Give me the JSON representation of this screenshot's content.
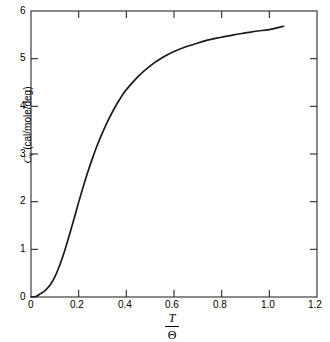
{
  "chart_data": {
    "type": "line",
    "title": "",
    "subtitle": "",
    "xlabel_numerator": "T",
    "xlabel_denominator": "Θ",
    "ylabel_symbol": "C",
    "ylabel_subscript": "v",
    "ylabel_units": "(cal/mole/deg)",
    "ylabel_full": "C_v (cal/mole/deg)",
    "xlim": [
      0,
      1.2
    ],
    "ylim": [
      0,
      6
    ],
    "xticks": [
      0,
      0.2,
      0.4,
      0.6,
      0.8,
      1.0,
      1.2
    ],
    "xtick_labels": [
      "0",
      "0.2",
      "0.4",
      "0.6",
      "0.8",
      "1.0",
      "1.2"
    ],
    "yticks": [
      0,
      1,
      2,
      3,
      4,
      5,
      6
    ],
    "ytick_labels": [
      "0",
      "1",
      "2",
      "3",
      "4",
      "5",
      "6"
    ],
    "grid": false,
    "legend": "none",
    "frame": "box",
    "tick_direction": "in",
    "line_color": "#1a1a1a",
    "background_color": "#ffffff",
    "series": [
      {
        "name": "Debye heat capacity",
        "x": [
          0.0,
          0.02,
          0.04,
          0.06,
          0.08,
          0.1,
          0.12,
          0.14,
          0.16,
          0.18,
          0.2,
          0.22,
          0.24,
          0.26,
          0.28,
          0.3,
          0.325,
          0.35,
          0.375,
          0.4,
          0.45,
          0.5,
          0.55,
          0.6,
          0.65,
          0.7,
          0.75,
          0.8,
          0.85,
          0.9,
          0.95,
          1.0,
          1.06
        ],
        "values": [
          0.0,
          0.009,
          0.07,
          0.14,
          0.25,
          0.42,
          0.66,
          0.95,
          1.28,
          1.63,
          1.99,
          2.33,
          2.65,
          2.94,
          3.21,
          3.45,
          3.72,
          3.96,
          4.17,
          4.35,
          4.63,
          4.85,
          5.02,
          5.15,
          5.25,
          5.33,
          5.4,
          5.45,
          5.5,
          5.54,
          5.58,
          5.61,
          5.68
        ]
      }
    ]
  },
  "axes": {
    "x_tick_labels": [
      "0",
      "0.2",
      "0.4",
      "0.6",
      "0.8",
      "1.0",
      "1.2"
    ],
    "y_tick_labels": [
      "0",
      "1",
      "2",
      "3",
      "4",
      "5",
      "6"
    ]
  },
  "labels": {
    "y_symbol": "C",
    "y_subscript": "v",
    "y_units": "(cal/mole/deg)",
    "x_numerator": "T",
    "x_denominator": "Θ"
  }
}
